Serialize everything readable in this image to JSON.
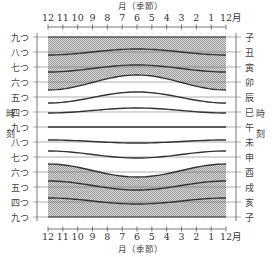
{
  "title_top": "月（季節）",
  "title_bottom": "月（季節）",
  "month_unit": "月",
  "months": [
    "12",
    "11",
    "10",
    "9",
    "8",
    "7",
    "6",
    "5",
    "4",
    "3",
    "2",
    "1",
    "12"
  ],
  "left_labels": [
    "九つ",
    "八つ",
    "七つ",
    "六つ",
    "五つ",
    "四つ",
    "九つ",
    "八つ",
    "七つ",
    "六つ",
    "五つ",
    "四つ",
    "九つ"
  ],
  "right_labels": [
    "子",
    "丑",
    "寅",
    "卯",
    "辰",
    "巳",
    "午",
    "未",
    "申",
    "酉",
    "戌",
    "亥",
    "子"
  ],
  "side_title_left": [
    "時",
    "刻"
  ],
  "side_title_right": [
    "時",
    "刻"
  ],
  "colors": {
    "line": "#333333",
    "grid": "#777777",
    "hatch": "#b8b8b8"
  },
  "curves": [
    {
      "name": "九つ(子) night",
      "edge": 37,
      "mid": 37
    },
    {
      "name": "八つ(丑)",
      "edge": 55,
      "mid": 49
    },
    {
      "name": "七つ(寅)",
      "edge": 72,
      "mid": 65
    },
    {
      "name": "六つ(卯) dawn",
      "edge": 90,
      "mid": 75
    },
    {
      "name": "五つ(辰)",
      "edge": 103,
      "mid": 92
    },
    {
      "name": "四つ(巳)",
      "edge": 113,
      "mid": 108
    },
    {
      "name": "九つ(午) noon",
      "edge": 127,
      "mid": 127
    },
    {
      "name": "八つ(未)",
      "edge": 140,
      "mid": 143
    },
    {
      "name": "七つ(申)",
      "edge": 151,
      "mid": 158
    },
    {
      "name": "六つ(酉) dusk",
      "edge": 164,
      "mid": 177
    },
    {
      "name": "五つ(戌)",
      "edge": 181,
      "mid": 190
    },
    {
      "name": "四つ(亥)",
      "edge": 198,
      "mid": 204
    },
    {
      "name": "九つ(子) night",
      "edge": 217,
      "mid": 217
    }
  ]
}
